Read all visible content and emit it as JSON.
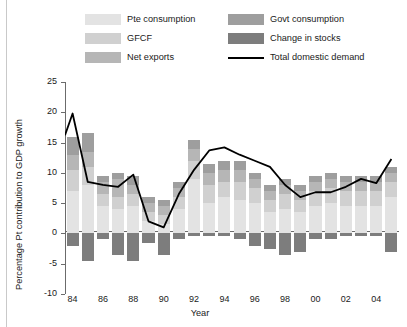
{
  "legend": {
    "items": [
      {
        "name": "pte-consumption",
        "label": "Pte consumption",
        "color": "#e3e3e3",
        "type": "swatch",
        "col": 0,
        "row": 0
      },
      {
        "name": "gfcf",
        "label": "GFCF",
        "color": "#d0d0d0",
        "type": "swatch",
        "col": 0,
        "row": 1
      },
      {
        "name": "net-exports",
        "label": "Net exports",
        "color": "#b6b6b6",
        "type": "swatch",
        "col": 0,
        "row": 2
      },
      {
        "name": "govt-consumption",
        "label": "Govt consumption",
        "color": "#9e9e9e",
        "type": "swatch",
        "col": 1,
        "row": 0
      },
      {
        "name": "change-in-stocks",
        "label": "Change in stocks",
        "color": "#7d7d7d",
        "type": "swatch",
        "col": 1,
        "row": 1
      },
      {
        "name": "total-domestic-demand",
        "label": "Total domestic demand",
        "color": "#000000",
        "type": "line",
        "col": 1,
        "row": 2
      }
    ]
  },
  "axes": {
    "ylabel": "Percentage Pt contribution to GDP growth",
    "xlabel": "Year",
    "yticks": [
      "25",
      "20",
      "15",
      "10",
      "5",
      "0",
      "-5",
      "-10"
    ],
    "ytick_values": [
      25,
      20,
      15,
      10,
      5,
      0,
      -5,
      -10
    ],
    "ylim": [
      -10,
      25
    ],
    "xticks": [
      "84",
      "86",
      "88",
      "90",
      "92",
      "94",
      "96",
      "98",
      "00",
      "02",
      "04"
    ],
    "xtick_years": [
      1984,
      1986,
      1988,
      1990,
      1992,
      1994,
      1996,
      1998,
      2000,
      2002,
      2004
    ],
    "grid": false
  },
  "chart_data": {
    "type": "bar",
    "title": "",
    "subtitle": "",
    "xlabel": "Year",
    "ylabel": "Percentage Pt contribution to GDP growth",
    "ylim": [
      -10,
      25
    ],
    "grid": false,
    "legend_position": "top",
    "stacked": true,
    "categories": [
      "84",
      "85",
      "86",
      "87",
      "88",
      "89",
      "90",
      "91",
      "92",
      "93",
      "94",
      "95",
      "96",
      "97",
      "98",
      "99",
      "00",
      "01",
      "02",
      "03",
      "04",
      "05"
    ],
    "years": [
      1984,
      1985,
      1986,
      1987,
      1988,
      1989,
      1990,
      1991,
      1992,
      1993,
      1994,
      1995,
      1996,
      1997,
      1998,
      1999,
      2000,
      2001,
      2002,
      2003,
      2004,
      2005
    ],
    "series": [
      {
        "name": "Pte consumption",
        "color": "#e3e3e3",
        "values": [
          7.0,
          8.0,
          4.5,
          4.0,
          4.5,
          2.0,
          1.5,
          4.0,
          9.0,
          5.0,
          6.0,
          5.5,
          5.0,
          3.5,
          4.0,
          3.5,
          4.5,
          5.0,
          4.5,
          4.5,
          4.5,
          6.0
        ]
      },
      {
        "name": "GFCF",
        "color": "#d0d0d0",
        "values": [
          3.5,
          3.0,
          2.0,
          2.0,
          2.0,
          1.5,
          1.5,
          2.0,
          3.0,
          3.0,
          2.5,
          3.0,
          2.5,
          2.0,
          2.5,
          2.0,
          2.5,
          2.5,
          2.5,
          2.5,
          2.5,
          2.5
        ]
      },
      {
        "name": "Net exports",
        "color": "#b6b6b6",
        "values": [
          2.5,
          2.5,
          2.0,
          3.0,
          1.5,
          1.5,
          1.5,
          1.5,
          2.0,
          2.0,
          2.0,
          2.0,
          1.5,
          1.5,
          1.5,
          1.5,
          1.5,
          1.5,
          1.5,
          1.5,
          1.5,
          1.5
        ]
      },
      {
        "name": "Govt consumption",
        "color": "#9e9e9e",
        "values": [
          3.0,
          3.0,
          1.0,
          1.0,
          1.5,
          1.0,
          1.0,
          1.0,
          1.5,
          1.5,
          1.5,
          1.5,
          1.0,
          1.0,
          1.0,
          1.0,
          1.0,
          1.0,
          1.0,
          1.0,
          1.0,
          1.0
        ]
      },
      {
        "name": "Change in stocks",
        "color": "#7d7d7d",
        "values": [
          -2.0,
          -4.5,
          -1.0,
          -3.5,
          -4.5,
          -1.5,
          -3.5,
          -1.0,
          -0.5,
          -0.5,
          -0.5,
          -1.0,
          -2.0,
          -2.5,
          -3.5,
          -3.0,
          -1.0,
          -1.0,
          -0.5,
          -0.5,
          -0.5,
          -3.0
        ]
      }
    ],
    "line_series": {
      "name": "Total domestic demand",
      "color": "#000000",
      "values": [
        16.2,
        19.8,
        8.5,
        8.0,
        7.7,
        9.7,
        2.0,
        1.0,
        6.5,
        10.5,
        13.7,
        14.2,
        13.0,
        12.0,
        11.0,
        8.0,
        6.0,
        6.8,
        6.8,
        7.7,
        9.0,
        8.3,
        12.3
      ]
    }
  }
}
